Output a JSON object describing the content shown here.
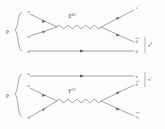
{
  "figure": {
    "line_color": "#5a5a5a",
    "text_color": "#4a4a4a",
    "background": "#fdfdfd"
  },
  "diagram_top": {
    "initial_label": "p",
    "incoming": [
      {
        "name": "u-top",
        "label": "u"
      },
      {
        "name": "u-mid",
        "label": "u"
      },
      {
        "name": "d-bot",
        "label": "d"
      }
    ],
    "boson": {
      "symbol": "X",
      "exponent": "4/3"
    },
    "outgoing": [
      {
        "name": "positron",
        "label": "e",
        "sup": "+"
      },
      {
        "name": "anti-d",
        "label": "d",
        "bar": true
      },
      {
        "name": "d",
        "label": "d",
        "bar": false
      }
    ],
    "bound_state": {
      "symbol": "π",
      "sup": "0"
    }
  },
  "diagram_bottom": {
    "initial_label": "p",
    "incoming": [
      {
        "name": "u-top",
        "label": "u"
      },
      {
        "name": "u-mid",
        "label": "u"
      },
      {
        "name": "d-bot",
        "label": "d"
      }
    ],
    "boson": {
      "symbol": "Y",
      "exponent": "1/3"
    },
    "outgoing": [
      {
        "name": "u",
        "label": "u",
        "bar": false
      },
      {
        "name": "anti-d",
        "label": "d",
        "bar": true
      },
      {
        "name": "anti-neutrino",
        "label": "ν",
        "bar": true,
        "sub": "e"
      }
    ],
    "bound_state": {
      "symbol": "π",
      "sup": "+"
    }
  }
}
